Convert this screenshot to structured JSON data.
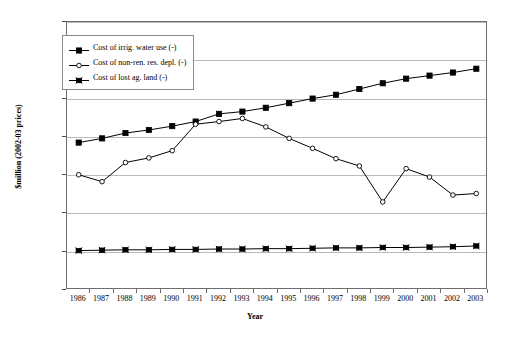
{
  "chart_data": {
    "type": "line",
    "title": "",
    "xlabel": "Year",
    "ylabel": "$million (2002-03 prices)",
    "categories": [
      "1986",
      "1987",
      "1988",
      "1989",
      "1990",
      "1991",
      "1992",
      "1993",
      "1994",
      "1995",
      "1996",
      "1997",
      "1998",
      "1999",
      "2000",
      "2001",
      "2002",
      "2003"
    ],
    "ylim": [
      0,
      7000
    ],
    "yticks": [
      0,
      1000,
      2000,
      3000,
      4000,
      5000,
      6000,
      7000
    ],
    "ytick_labels": [
      "0.0",
      "1,000.0",
      "2,000.0",
      "3,000.0",
      "4,000.0",
      "5,000.0",
      "6,000.0",
      "7,000.0"
    ],
    "grid": true,
    "legend_position": "upper-left-inside",
    "series": [
      {
        "name": "Cost of irrig. water use (-)",
        "marker": "filled-square",
        "values": [
          3850,
          3960,
          4100,
          4180,
          4280,
          4400,
          4600,
          4660,
          4760,
          4880,
          5000,
          5100,
          5250,
          5400,
          5520,
          5600,
          5680,
          5780
        ]
      },
      {
        "name": "Cost of non-ren. res. depl. (-)",
        "marker": "open-circle",
        "values": [
          3010,
          2830,
          3330,
          3450,
          3640,
          4330,
          4400,
          4480,
          4260,
          3960,
          3700,
          3430,
          3240,
          2300,
          3170,
          2950,
          2480,
          2520
        ]
      },
      {
        "name": "Cost of lost ag. land (-)",
        "marker": "crossed-square",
        "values": [
          1030,
          1040,
          1050,
          1050,
          1060,
          1060,
          1070,
          1070,
          1080,
          1080,
          1090,
          1100,
          1100,
          1110,
          1110,
          1120,
          1130,
          1150
        ]
      }
    ]
  }
}
